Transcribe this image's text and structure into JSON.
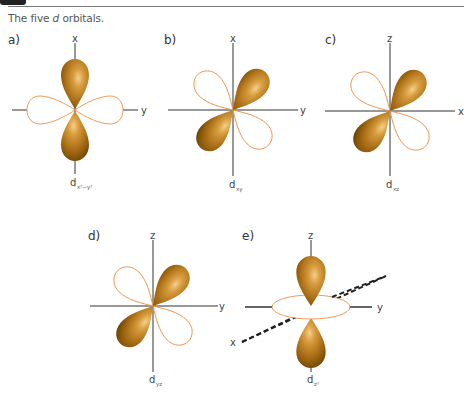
{
  "header": {
    "caption_prefix": "The five ",
    "caption_italic": "d",
    "caption_suffix": " orbitals."
  },
  "colors": {
    "lobe_fill": "#b07a1e",
    "lobe_highlight": "#f3c47a",
    "lobe_shadow": "#7a4e08",
    "outline_lobe": "#e8914a",
    "axis": "#333333"
  },
  "panels": [
    {
      "id": "a",
      "label": "a)",
      "orbital": "d",
      "subscript": "x²−y²",
      "vertical_axis": "x",
      "horizontal_axis": "y"
    },
    {
      "id": "b",
      "label": "b)",
      "orbital": "d",
      "subscript": "xy",
      "vertical_axis": "x",
      "horizontal_axis": "y"
    },
    {
      "id": "c",
      "label": "c)",
      "orbital": "d",
      "subscript": "xz",
      "vertical_axis": "z",
      "horizontal_axis": "x"
    },
    {
      "id": "d",
      "label": "d)",
      "orbital": "d",
      "subscript": "yz",
      "vertical_axis": "z",
      "horizontal_axis": "y"
    },
    {
      "id": "e",
      "label": "e)",
      "orbital": "d",
      "subscript": "z²",
      "vertical_axis": "z",
      "horizontal_axis": "y",
      "diagonal_axis": "x"
    }
  ]
}
